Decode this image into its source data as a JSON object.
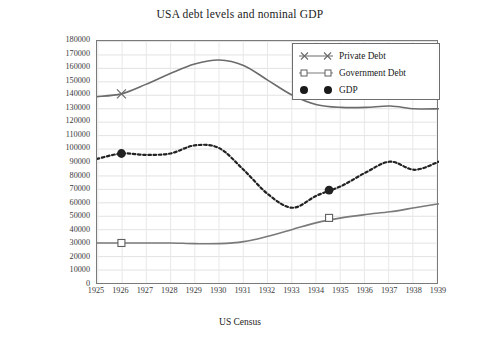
{
  "chart_data": {
    "type": "line",
    "title": "USA debt levels and nominal GDP",
    "xlabel": "US Census",
    "ylabel": "US $ million",
    "xlim": [
      1925,
      1939
    ],
    "ylim": [
      0,
      180000
    ],
    "ytick_step": 10000,
    "grid": true,
    "legend_position": "top-right",
    "x": [
      1925,
      1926,
      1927,
      1928,
      1929,
      1930,
      1931,
      1932,
      1933,
      1934,
      1935,
      1936,
      1937,
      1938,
      1939
    ],
    "xticklabels": [
      "1925",
      "1926",
      "1927",
      "1928",
      "1929",
      "1930",
      "1931",
      "1932",
      "1933",
      "1934",
      "1935",
      "1936",
      "1937",
      "1938",
      "1939"
    ],
    "yticklabels": [
      "0",
      "10000",
      "20000",
      "30000",
      "40000",
      "50000",
      "60000",
      "70000",
      "80000",
      "90000",
      "100000",
      "110000",
      "120000",
      "130000",
      "140000",
      "150000",
      "160000",
      "170000",
      "180000"
    ],
    "series": [
      {
        "name": "Private Debt",
        "marker": "x-marker",
        "linestyle": "solid",
        "color": "#6b6b6b",
        "values": [
          139000,
          141000,
          148000,
          156000,
          163000,
          166000,
          162000,
          151000,
          140000,
          133000,
          131000,
          131000,
          132000,
          130000,
          130000
        ],
        "marked_points": [
          {
            "x": 1926,
            "y": 141000
          }
        ]
      },
      {
        "name": "Government Debt",
        "marker": "square-marker",
        "linestyle": "solid",
        "color": "#7a7a7a",
        "values": [
          31000,
          31000,
          31000,
          31000,
          30500,
          30500,
          32000,
          36000,
          41000,
          46000,
          49500,
          52000,
          54000,
          57000,
          60000
        ],
        "marked_points": [
          {
            "x": 1926,
            "y": 31000
          },
          {
            "x": 1934.5,
            "y": 49500
          }
        ]
      },
      {
        "name": "GDP",
        "marker": "filled-circle",
        "linestyle": "dotted",
        "color": "#222222",
        "values": [
          93000,
          97000,
          96000,
          97000,
          103000,
          101000,
          85000,
          67000,
          57000,
          66000,
          73000,
          83000,
          91000,
          85000,
          91000
        ],
        "marked_points": [
          {
            "x": 1926,
            "y": 97000
          },
          {
            "x": 1934.5,
            "y": 70000
          }
        ]
      }
    ]
  },
  "legend": {
    "items": [
      {
        "label": "Private Debt",
        "key": "x-marker"
      },
      {
        "label": "Government Debt",
        "key": "square-marker"
      },
      {
        "label": "GDP",
        "key": "filled-circle"
      }
    ]
  }
}
